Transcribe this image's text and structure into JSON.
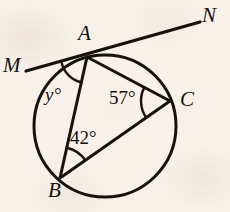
{
  "figure": {
    "kind": "circle-geometry-diagram",
    "width": 230,
    "height": 212,
    "background_color": "#f7f1e9",
    "ink_color": "#16120e"
  },
  "circle": {
    "name": "main-circle",
    "center_x": 105,
    "center_y": 126,
    "radius": 71,
    "stroke_width": 3.0
  },
  "points": {
    "A": {
      "label": "A",
      "x": 87,
      "y": 57,
      "label_x": 78,
      "label_y": 23
    },
    "B": {
      "label": "B",
      "x": 60,
      "y": 178,
      "label_x": 48,
      "label_y": 180
    },
    "C": {
      "label": "C",
      "x": 170,
      "y": 101,
      "label_x": 180,
      "label_y": 89
    },
    "M": {
      "label": "M",
      "x": 26,
      "y": 71,
      "label_x": 3,
      "label_y": 55
    },
    "N": {
      "label": "N",
      "x": 200,
      "y": 22,
      "label_x": 202,
      "label_y": 5
    }
  },
  "segments": [
    {
      "name": "tangent-line-MN",
      "from": "M",
      "to": "N",
      "stroke_width": 3.2
    },
    {
      "name": "chord-AB",
      "from": "A",
      "to": "B",
      "stroke_width": 3.0
    },
    {
      "name": "chord-AC",
      "from": "A",
      "to": "C",
      "stroke_width": 3.0
    },
    {
      "name": "chord-BC",
      "from": "B",
      "to": "C",
      "stroke_width": 3.0
    }
  ],
  "angles": [
    {
      "name": "angle-y-at-A",
      "label": "y°",
      "vertex": "A",
      "between": [
        "M",
        "B"
      ],
      "label_x": 45,
      "label_y": 85,
      "arc_radius": 26
    },
    {
      "name": "angle-57-at-C",
      "label": "57°",
      "vertex": "C",
      "between": [
        "A",
        "B"
      ],
      "label_x": 109,
      "label_y": 88,
      "arc_radius": 29
    },
    {
      "name": "angle-42-at-B",
      "label": "42°",
      "vertex": "B",
      "between": [
        "A",
        "C"
      ],
      "label_x": 70,
      "label_y": 128,
      "arc_radius": 31
    }
  ]
}
